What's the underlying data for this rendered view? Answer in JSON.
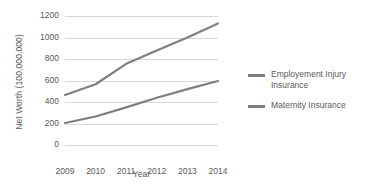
{
  "chart_data": {
    "type": "line",
    "title": "",
    "xlabel": "Year",
    "ylabel": "Net Worth (100,000,000)",
    "categories": [
      "2009",
      "2010",
      "2011",
      "2012",
      "2013",
      "2014"
    ],
    "x": [
      2009,
      2010,
      2011,
      2012,
      2013,
      2014
    ],
    "ylim": [
      0,
      1200
    ],
    "yticks": [
      0,
      200,
      400,
      600,
      800,
      1000,
      1200
    ],
    "ytick_labels": [
      "0",
      "200",
      "400",
      "600",
      "800",
      "1000",
      "1200"
    ],
    "grid": "horizontal",
    "legend_position": "right",
    "series": [
      {
        "name": "Employement Injury Insurance",
        "color": "#7f7f7f",
        "values": [
          465,
          565,
          755,
          880,
          1000,
          1130
        ]
      },
      {
        "name": "Maternity Insurance",
        "color": "#7f7f7f",
        "values": [
          205,
          265,
          350,
          440,
          520,
          595
        ]
      }
    ]
  },
  "legend": {
    "items": [
      {
        "label": "Employement Injury Insurance"
      },
      {
        "label": "Maternity Insurance"
      }
    ]
  },
  "colors": {
    "series_line": "#7f7f7f",
    "gridline": "#d9d9d9",
    "text": "#595959",
    "background": "#ffffff"
  }
}
